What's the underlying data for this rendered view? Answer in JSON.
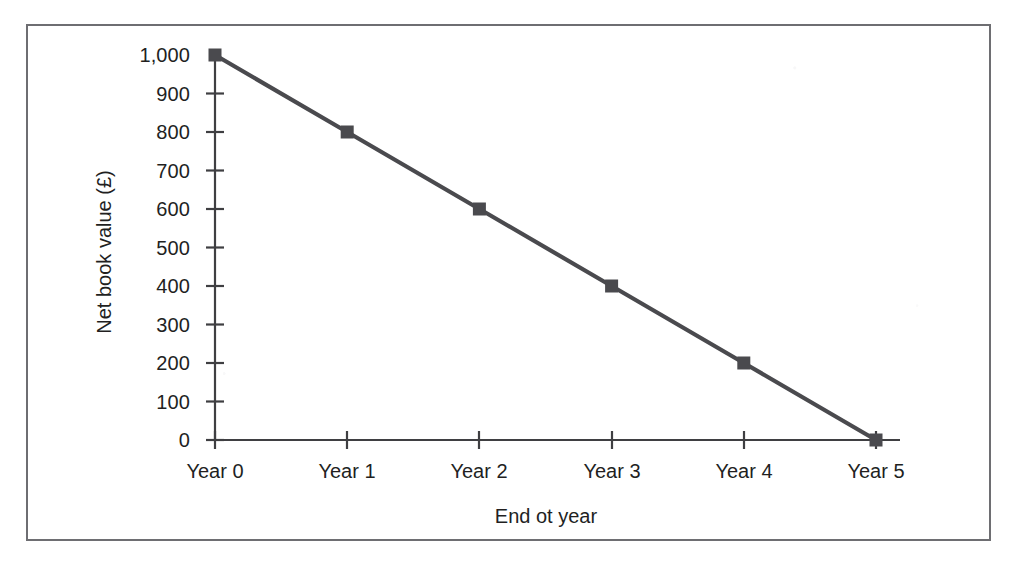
{
  "figure": {
    "background_color": "#ffffff",
    "frame_color": "#6e6e72",
    "axis_color": "#3f3f42",
    "text_color": "#221f1f"
  },
  "chart_data": {
    "type": "line",
    "title": "",
    "subtitle": "",
    "xlabel": "End ot year",
    "ylabel": "Net book value (£)",
    "categories": [
      "Year 0",
      "Year 1",
      "Year 2",
      "Year 3",
      "Year 4",
      "Year 5"
    ],
    "x_tick_labels": [
      "Year 0",
      "Year 1",
      "Year 2",
      "Year 3",
      "Year 4",
      "Year 5"
    ],
    "y_tick_labels": [
      "0",
      "100",
      "200",
      "300",
      "400",
      "500",
      "600",
      "700",
      "800",
      "900",
      "1,000"
    ],
    "y_tick_values": [
      0,
      100,
      200,
      300,
      400,
      500,
      600,
      700,
      800,
      900,
      1000
    ],
    "ylim": [
      0,
      1000
    ],
    "xlim": [
      0,
      5
    ],
    "grid": false,
    "legend": false,
    "legend_position": "none",
    "series": [
      {
        "name": "Net book value",
        "color": "#4a4a4e",
        "marker": "square",
        "x": [
          0,
          1,
          2,
          3,
          4,
          5
        ],
        "values": [
          1000,
          800,
          600,
          400,
          200,
          0
        ]
      }
    ],
    "annotations": []
  }
}
